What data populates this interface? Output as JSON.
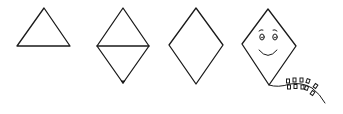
{
  "figure": {
    "background": "#ffffff",
    "stroke_color": "#1a1a1a",
    "steps": [
      {
        "id": "step-1",
        "label": "triangle",
        "points": [
          [
            44,
            8
          ],
          [
            70,
            46
          ],
          [
            17,
            46
          ]
        ]
      },
      {
        "id": "step-2",
        "label": "diamond-with-horizontal-line-and-dot",
        "points": [
          [
            123,
            8
          ],
          [
            149,
            46
          ],
          [
            123,
            83
          ],
          [
            97,
            46
          ]
        ],
        "crossbar": [
          [
            97,
            46
          ],
          [
            149,
            46
          ]
        ],
        "dot": [
          123,
          82
        ]
      },
      {
        "id": "step-3",
        "label": "diamond",
        "points": [
          [
            196,
            8
          ],
          [
            223,
            45
          ],
          [
            196,
            84
          ],
          [
            169,
            45
          ]
        ]
      },
      {
        "id": "step-4",
        "label": "kite-with-face-and-tail",
        "points": [
          [
            268,
            9
          ],
          [
            296,
            46
          ],
          [
            269,
            85
          ],
          [
            242,
            44
          ]
        ],
        "face": {
          "left_eye": [
            262,
            37
          ],
          "right_eye": [
            275,
            37
          ],
          "smile": "arc"
        },
        "tail": {
          "bows": 5
        }
      }
    ]
  }
}
